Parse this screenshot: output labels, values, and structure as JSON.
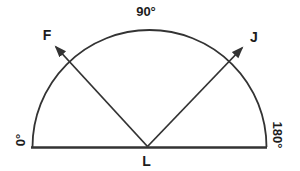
{
  "diagram": {
    "top_angle_label": "90°",
    "left_angle_label": "0°",
    "right_angle_label": "180°",
    "vertex_label": "L",
    "ray_f_label": "F",
    "ray_j_label": "J",
    "colors": {
      "line": "#333333",
      "text": "#1c1c1c",
      "background": "#ffffff"
    }
  }
}
